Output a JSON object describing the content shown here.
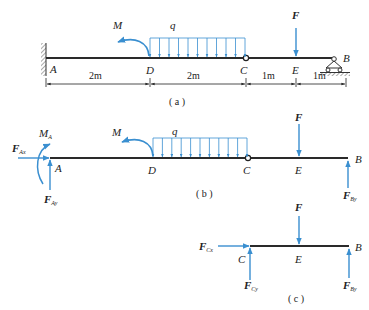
{
  "colors": {
    "beam": "#2a2a2a",
    "force": "#3a8fd0",
    "text": "#222222",
    "support": "#333333"
  },
  "figure_a": {
    "caption": "( a )",
    "points": {
      "A": "A",
      "D": "D",
      "C": "C",
      "E": "E",
      "B": "B"
    },
    "loads": {
      "moment": "M",
      "distributed": "q",
      "force": "F"
    },
    "dimensions": [
      "2m",
      "2m",
      "1m",
      "1m"
    ],
    "distributed_arrow_count": 11
  },
  "figure_b": {
    "caption": "( b )",
    "points": {
      "A": "A",
      "D": "D",
      "C": "C",
      "E": "E",
      "B": "B"
    },
    "loads": {
      "moment": "M",
      "distributed": "q",
      "force": "F"
    },
    "reactions": {
      "FAx": {
        "main": "F",
        "sub": "Ax"
      },
      "MA": {
        "main": "M",
        "sub": "A"
      },
      "FAy": {
        "main": "F",
        "sub": "Ay"
      },
      "FBy": {
        "main": "F",
        "sub": "By"
      }
    }
  },
  "figure_c": {
    "caption": "( c )",
    "points": {
      "C": "C",
      "E": "E",
      "B": "B"
    },
    "loads": {
      "force": "F"
    },
    "reactions": {
      "FCx": {
        "main": "F",
        "sub": "Cx"
      },
      "FCy": {
        "main": "F",
        "sub": "Cy"
      },
      "FBy": {
        "main": "F",
        "sub": "By"
      }
    }
  }
}
